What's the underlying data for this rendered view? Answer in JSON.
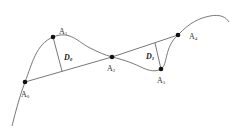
{
  "diagram": {
    "points": [
      {
        "id": "A0",
        "letter": "A",
        "sub": "0",
        "x": 25,
        "y": 82
      },
      {
        "id": "A1",
        "letter": "A",
        "sub": "1",
        "x": 53,
        "y": 37
      },
      {
        "id": "A2",
        "letter": "A",
        "sub": "2",
        "x": 112,
        "y": 57
      },
      {
        "id": "A3",
        "letter": "A",
        "sub": "3",
        "x": 161,
        "y": 69
      },
      {
        "id": "A4",
        "letter": "A",
        "sub": "4",
        "x": 178,
        "y": 35
      }
    ],
    "distances": [
      {
        "id": "D0",
        "letter": "D",
        "sub": "0",
        "from": "A1",
        "to_chord": "A0-A2"
      },
      {
        "id": "D1",
        "letter": "D",
        "sub": "1",
        "from": "A3",
        "to_chord": "A2-A4"
      }
    ],
    "chords": [
      {
        "from": "A0",
        "to": "A2"
      },
      {
        "from": "A2",
        "to": "A4"
      }
    ],
    "colors": {
      "curve": "#6a6a6a",
      "line": "#555555",
      "point": "#111111",
      "label": "#333333"
    }
  }
}
